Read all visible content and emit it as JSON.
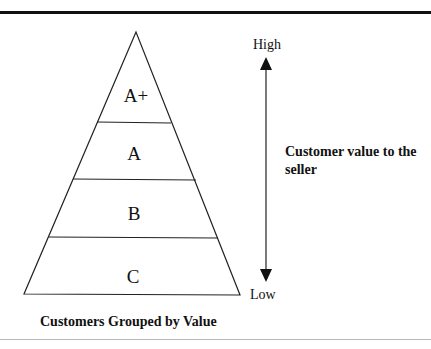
{
  "diagram": {
    "type": "pyramid",
    "tiers": [
      {
        "label": "A+"
      },
      {
        "label": "A"
      },
      {
        "label": "B"
      },
      {
        "label": "C"
      }
    ],
    "axis": {
      "high_label": "High",
      "low_label": "Low",
      "title": "Customer value to the seller"
    },
    "caption": "Customers Grouped by Value",
    "colors": {
      "stroke": "#222222",
      "background": "#ffffff"
    }
  }
}
